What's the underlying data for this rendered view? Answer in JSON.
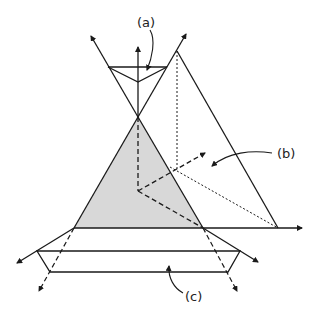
{
  "diagram": {
    "labels": {
      "a": "(a)",
      "b": "(b)",
      "c": "(c)"
    },
    "colors": {
      "line": "#1a1a1a",
      "fill": "#d8d8d8",
      "background": "#ffffff"
    }
  }
}
